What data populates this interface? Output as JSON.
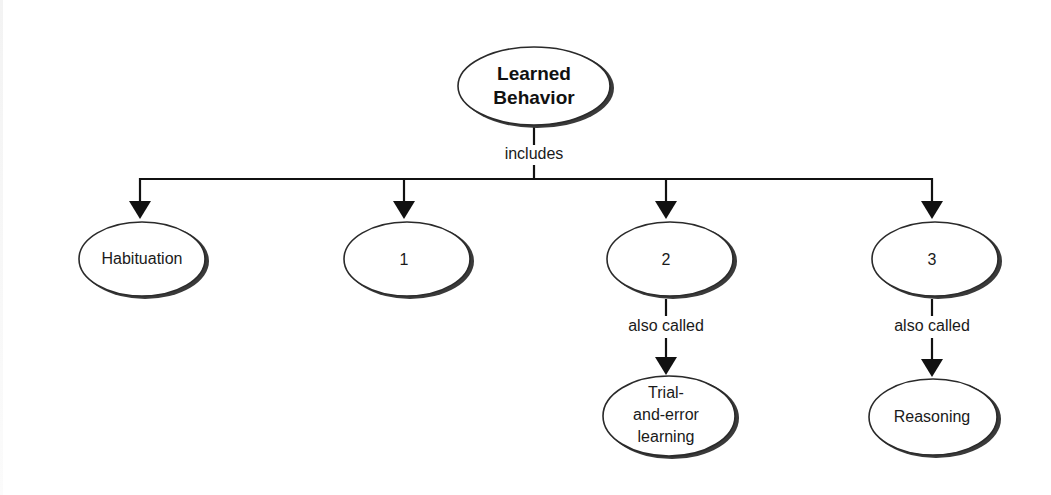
{
  "diagram": {
    "type": "concept-map",
    "root": {
      "id": "learned-behavior",
      "label_line1": "Learned",
      "label_line2": "Behavior",
      "bold": true
    },
    "root_link_label": "includes",
    "children": [
      {
        "id": "habituation",
        "label": "Habituation"
      },
      {
        "id": "blank-1",
        "label": "1"
      },
      {
        "id": "blank-2",
        "label": "2"
      },
      {
        "id": "blank-3",
        "label": "3"
      }
    ],
    "sub_links": [
      {
        "from": "blank-2",
        "link_label": "also called",
        "to": {
          "id": "trial-and-error-learning",
          "label_line1": "Trial-",
          "label_line2": "and-error",
          "label_line3": "learning"
        }
      },
      {
        "from": "blank-3",
        "link_label": "also called",
        "to": {
          "id": "reasoning",
          "label": "Reasoning"
        }
      }
    ]
  },
  "colors": {
    "line": "#111111",
    "node_border": "#2a2a2a",
    "node_shadow": "#3a3a3a",
    "node_fill": "#ffffff",
    "text": "#1a1a1a",
    "background": "#ffffff"
  }
}
